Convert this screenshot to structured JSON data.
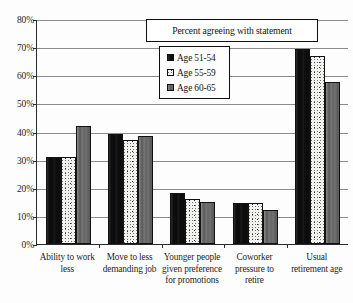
{
  "chart_data": {
    "type": "bar",
    "title": "Percent agreeing with statement",
    "xlabel": "",
    "ylabel": "",
    "ylim": [
      0,
      80
    ],
    "ytick_labels": [
      "0%",
      "10%",
      "20%",
      "30%",
      "40%",
      "50%",
      "60%",
      "70%",
      "80%"
    ],
    "ytick_values": [
      0,
      10,
      20,
      30,
      40,
      50,
      60,
      70,
      80
    ],
    "grid": true,
    "legend_position": "upper center",
    "categories": [
      "Ability to work less",
      "Move to less demanding job",
      "Younger people given preference for promotions",
      "Coworker pressure to retire",
      "Usual retirement age"
    ],
    "category_lines": [
      [
        "Ability to work",
        "less"
      ],
      [
        "Move to less",
        "demanding job"
      ],
      [
        "Younger people",
        "given preference",
        "for promotions"
      ],
      [
        "Coworker",
        "pressure to",
        "retire"
      ],
      [
        "Usual",
        "retirement age"
      ]
    ],
    "series": [
      {
        "name": "Age 51-54",
        "color": "#0d0d0d",
        "pattern": "solid-black",
        "values": [
          31,
          39,
          18,
          14.5,
          69.5
        ]
      },
      {
        "name": "Age 55-59",
        "color": "#f2f2f0",
        "pattern": "speckled-light",
        "values": [
          31,
          37,
          16,
          14.5,
          67
        ]
      },
      {
        "name": "Age 60-65",
        "color": "#6b6b6b",
        "pattern": "solid-gray",
        "values": [
          42,
          38.5,
          15,
          12,
          57.5
        ]
      }
    ]
  }
}
